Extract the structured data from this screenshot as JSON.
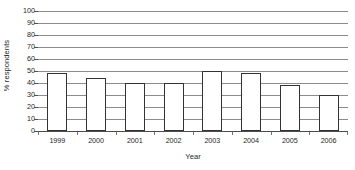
{
  "chart_data": {
    "type": "bar",
    "title": "",
    "subtitle": "",
    "xlabel": "Year",
    "ylabel": "% respondents",
    "categories": [
      "1999",
      "2000",
      "2001",
      "2002",
      "2003",
      "2004",
      "2005",
      "2006"
    ],
    "values": [
      48,
      44,
      40,
      40,
      50,
      48,
      38,
      30
    ],
    "series": [
      {
        "name": "% respondents",
        "values": [
          48,
          44,
          40,
          40,
          50,
          48,
          38,
          30
        ]
      }
    ],
    "ylim": [
      0,
      100
    ],
    "ytick_interval": 10,
    "yticks": [
      0,
      10,
      20,
      30,
      40,
      50,
      60,
      70,
      80,
      90,
      100
    ],
    "ytick_labels": [
      "0",
      "10",
      "20",
      "30",
      "40",
      "50",
      "60",
      "70",
      "80",
      "90",
      "100"
    ],
    "grid": true,
    "grid_axis": "y",
    "legend": false,
    "legend_position": "none",
    "bar_fill_color": "#ffffff",
    "bar_border_color": "#333333",
    "gridline_color": "#8c8c8c",
    "axis_color": "#4d4d4d",
    "background_color": "#ffffff",
    "annotations": []
  }
}
